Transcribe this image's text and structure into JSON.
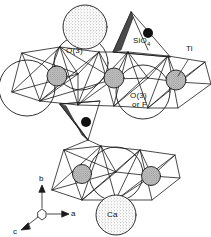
{
  "figure": {
    "kind": "crystal-structure-diagram",
    "background_color": "#ffffff",
    "line_color": "#1a1a1a",
    "labels": {
      "o3_upper": "O(3)",
      "sio4": "SiO",
      "sio4_subscript": "4",
      "ti": "Ti",
      "o3_or_f_line1": "O(3)",
      "o3_or_f_line2": "or F",
      "ca": "Ca"
    },
    "axes": {
      "b_label": "b",
      "a_label": "a",
      "c_label": "c"
    },
    "legend_symbols": {
      "stippled_circle": "Ca atom (large stippled sphere)",
      "open_circle": "O(3) / O(3) or F oxygen site (large open circle)",
      "hatched_circle": "Ti atom (small hatched sphere)",
      "black_dot": "Si atom (small filled dot)",
      "shaded_wedge": "SiO4 tetrahedron face (dark shaded)"
    }
  }
}
